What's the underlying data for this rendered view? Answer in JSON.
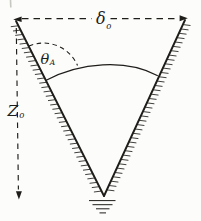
{
  "diagram": {
    "name": "v-groove-meniscus-figure",
    "labels": {
      "groove_width": {
        "base": "δ",
        "sub": "o"
      },
      "contact_angle": {
        "base": "θ",
        "sub": "A"
      },
      "groove_depth": {
        "base": "Z",
        "sub": "o"
      }
    },
    "colors": {
      "ink": "#1f1d1a",
      "paper": "#fcfcfa"
    }
  }
}
